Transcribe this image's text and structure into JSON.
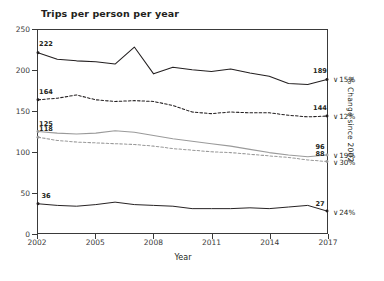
{
  "chart_data": {
    "type": "line",
    "title": "Trips per person per year",
    "xlabel": "Year",
    "ylabel": "",
    "right_axis_label": "% Change since 2002",
    "xlim": [
      2002,
      2017
    ],
    "ylim": [
      0,
      250
    ],
    "grid": false,
    "legend": "none",
    "x": [
      2002,
      2003,
      2004,
      2005,
      2006,
      2007,
      2008,
      2009,
      2010,
      2011,
      2012,
      2013,
      2014,
      2015,
      2016,
      2017
    ],
    "y_ticks": [
      0,
      50,
      100,
      150,
      200,
      250
    ],
    "x_ticks": [
      2002,
      2005,
      2008,
      2011,
      2014,
      2017
    ],
    "series": [
      {
        "name": "series-1",
        "style": "solid",
        "color": "#231f20",
        "start_value": 222,
        "end_value": 189,
        "change_since_2002": "15%",
        "change_direction": "down",
        "values": [
          222,
          214,
          212,
          211,
          208,
          229,
          196,
          204,
          201,
          199,
          202,
          197,
          193,
          184,
          183,
          189
        ]
      },
      {
        "name": "series-2",
        "style": "dashed",
        "color": "#231f20",
        "start_value": 164,
        "end_value": 144,
        "change_since_2002": "12%",
        "change_direction": "down",
        "values": [
          164,
          166,
          170,
          164,
          162,
          163,
          162,
          157,
          149,
          147,
          149,
          148,
          148,
          145,
          143,
          144
        ]
      },
      {
        "name": "series-3",
        "style": "solid",
        "color": "#9a9a9a",
        "start_value": 125,
        "end_value": 96,
        "change_since_2002": "19%",
        "change_direction": "down",
        "values": [
          125,
          123,
          122,
          123,
          126,
          124,
          120,
          116,
          113,
          110,
          107,
          103,
          99,
          96,
          94,
          96
        ]
      },
      {
        "name": "series-4",
        "style": "dashed",
        "color": "#9a9a9a",
        "start_value": 118,
        "end_value": 88,
        "change_since_2002": "30%",
        "change_direction": "down",
        "values": [
          118,
          114,
          112,
          111,
          110,
          109,
          107,
          104,
          102,
          100,
          99,
          97,
          95,
          93,
          90,
          88
        ]
      },
      {
        "name": "series-5",
        "style": "solid",
        "color": "#231f20",
        "start_value": 36,
        "end_value": 27,
        "change_since_2002": "24%",
        "change_direction": "down",
        "values": [
          36,
          34,
          33,
          35,
          38,
          35,
          34,
          33,
          30,
          30,
          30,
          31,
          30,
          32,
          34,
          27
        ]
      }
    ],
    "value_labels": [
      {
        "text": "222",
        "series": 0,
        "at": "start"
      },
      {
        "text": "189",
        "series": 0,
        "at": "end"
      },
      {
        "text": "164",
        "series": 1,
        "at": "start"
      },
      {
        "text": "144",
        "series": 1,
        "at": "end"
      },
      {
        "text": "125",
        "series": 2,
        "at": "start"
      },
      {
        "text": "96",
        "series": 2,
        "at": "end"
      },
      {
        "text": "118",
        "series": 3,
        "at": "start"
      },
      {
        "text": "88",
        "series": 3,
        "at": "end"
      },
      {
        "text": "36",
        "series": 4,
        "at": "start"
      },
      {
        "text": "27",
        "series": 4,
        "at": "end"
      }
    ],
    "percent_markers": [
      {
        "text": "15%",
        "arrow": "∨",
        "series": 0
      },
      {
        "text": "12%",
        "arrow": "∨",
        "series": 1
      },
      {
        "text": "19%",
        "arrow": "∨",
        "series": 2
      },
      {
        "text": "30%",
        "arrow": "∨",
        "series": 3
      },
      {
        "text": "24%",
        "arrow": "∨",
        "series": 4
      }
    ]
  },
  "colors": {
    "background": "#ffffff",
    "axis": "#3a3a3a",
    "text": "#231f20",
    "series_dark": "#231f20",
    "series_gray": "#9a9a9a"
  }
}
